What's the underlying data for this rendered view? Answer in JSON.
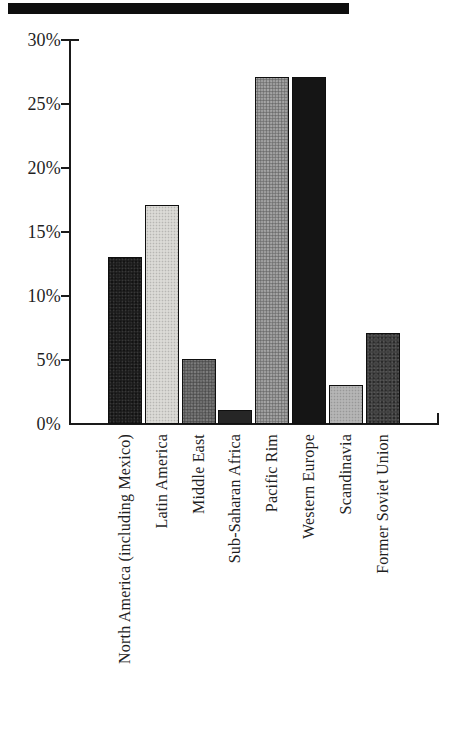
{
  "figure": {
    "background": "#ffffff",
    "axis_color": "#1a1a1a",
    "text_color": "#1f1f1f",
    "scan_artifact_color": "#0e0e0e"
  },
  "chart_data": {
    "type": "bar",
    "title": "",
    "xlabel": "",
    "ylabel": "",
    "grid": false,
    "legend": null,
    "ylim": [
      0,
      30
    ],
    "value_unit": "%",
    "categories": [
      "North America (including Mexico)",
      "Latin America",
      "Middle East",
      "Sub-Saharan Africa",
      "Pacific Rim",
      "Western Europe",
      "Scandinavia",
      "Former Soviet Union"
    ],
    "values": [
      13,
      17,
      5,
      1,
      27,
      27,
      3,
      7
    ],
    "ytick_values": [
      0,
      5,
      10,
      15,
      20,
      25,
      30
    ],
    "ytick_labels": [
      "0%",
      "5%",
      "10%",
      "15%",
      "20%",
      "25%",
      "30%"
    ],
    "bar_styles": [
      {
        "fill": "#1c1c1c",
        "texture": "halftone-dark"
      },
      {
        "fill": "#e5e4e0",
        "texture": "halftone-light"
      },
      {
        "fill": "#6f6f6f",
        "texture": "halftone-mid"
      },
      {
        "fill": "#262626",
        "texture": "solid"
      },
      {
        "fill": "#9c9c9c",
        "texture": "halftone-mid"
      },
      {
        "fill": "#151515",
        "texture": "solid"
      },
      {
        "fill": "#bdbdbd",
        "texture": "halftone-light"
      },
      {
        "fill": "#3f3f3f",
        "texture": "halftone-dark"
      }
    ]
  }
}
